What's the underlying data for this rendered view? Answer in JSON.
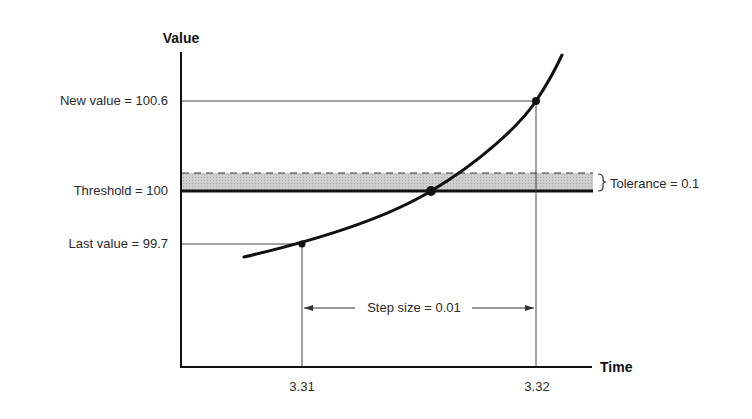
{
  "diagram": {
    "type": "threshold-crossing",
    "y_axis_title": "Value",
    "x_axis_title": "Time",
    "labels": {
      "new_value": "New value = 100.6",
      "threshold": "Threshold = 100",
      "last_value": "Last value = 99.7",
      "tolerance": "Tolerance = 0.1",
      "step_size": "Step size = 0.01"
    },
    "x_ticks": [
      "3.31",
      "3.32"
    ],
    "values": {
      "new_value": 100.6,
      "threshold": 100,
      "last_value": 99.7,
      "tolerance": 0.1,
      "step_size": 0.01,
      "t_last": 3.31,
      "t_new": 3.32
    },
    "colors": {
      "line": "#111111",
      "guide": "#444444",
      "band_fill": "#c8c8c8",
      "text": "#2a2a2a"
    }
  }
}
